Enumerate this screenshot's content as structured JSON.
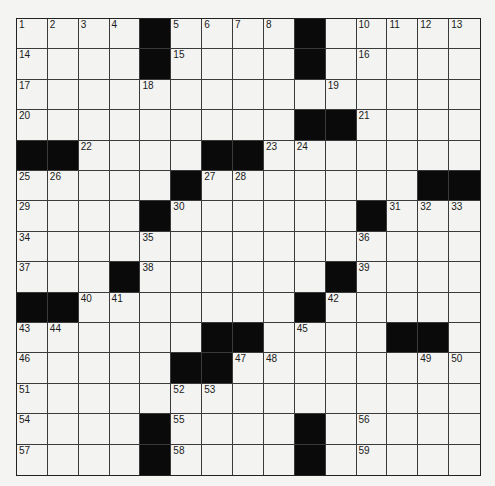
{
  "puzzle": {
    "rows": 15,
    "cols": 15,
    "layout": [
      "....#....#.....",
      "....#....#.....",
      "...............",
      ".........##....",
      "##....##.......",
      ".....#.......##",
      "....#......#...",
      "...............",
      "...#......#....",
      "##.......#.....",
      "......##....##.",
      ".....##........",
      "...............",
      "....#....#.....",
      "....#....#....."
    ],
    "numbers": [
      [
        1,
        2,
        3,
        4,
        0,
        5,
        6,
        7,
        8,
        9,
        0,
        10,
        11,
        12,
        13
      ],
      [
        14,
        0,
        0,
        0,
        0,
        15,
        0,
        0,
        0,
        0,
        0,
        16,
        0,
        0,
        0
      ],
      [
        17,
        0,
        0,
        0,
        18,
        0,
        0,
        0,
        0,
        0,
        19,
        0,
        0,
        0,
        0
      ],
      [
        20,
        0,
        0,
        0,
        0,
        0,
        0,
        0,
        0,
        0,
        0,
        21,
        0,
        0,
        0
      ],
      [
        0,
        0,
        22,
        0,
        0,
        0,
        0,
        0,
        23,
        24,
        0,
        0,
        0,
        0,
        0
      ],
      [
        25,
        26,
        0,
        0,
        0,
        0,
        27,
        28,
        0,
        0,
        0,
        0,
        0,
        0,
        0
      ],
      [
        29,
        0,
        0,
        0,
        0,
        30,
        0,
        0,
        0,
        0,
        0,
        0,
        31,
        32,
        33
      ],
      [
        34,
        0,
        0,
        0,
        35,
        0,
        0,
        0,
        0,
        0,
        0,
        36,
        0,
        0,
        0
      ],
      [
        37,
        0,
        0,
        0,
        38,
        0,
        0,
        0,
        0,
        0,
        0,
        39,
        0,
        0,
        0
      ],
      [
        0,
        0,
        40,
        41,
        0,
        0,
        0,
        0,
        0,
        0,
        42,
        0,
        0,
        0,
        0
      ],
      [
        43,
        44,
        0,
        0,
        0,
        0,
        0,
        0,
        0,
        45,
        0,
        0,
        0,
        0,
        0
      ],
      [
        46,
        0,
        0,
        0,
        0,
        0,
        0,
        47,
        48,
        0,
        0,
        0,
        0,
        49,
        50
      ],
      [
        51,
        0,
        0,
        0,
        0,
        52,
        53,
        0,
        0,
        0,
        0,
        0,
        0,
        0,
        0
      ],
      [
        54,
        0,
        0,
        0,
        0,
        55,
        0,
        0,
        0,
        0,
        0,
        56,
        0,
        0,
        0
      ],
      [
        57,
        0,
        0,
        0,
        0,
        58,
        0,
        0,
        0,
        0,
        0,
        59,
        0,
        0,
        0
      ]
    ],
    "colors": {
      "block": "#0a0a0a",
      "cell": "#f3f3f1",
      "line": "#3a3a3a",
      "page": "#f4f4f2"
    }
  }
}
